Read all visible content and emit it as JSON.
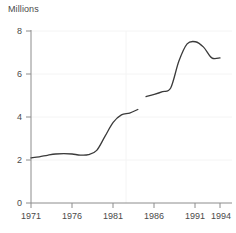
{
  "chart_data": {
    "type": "line",
    "title": "",
    "ylabel": "Millions",
    "xlabel": "",
    "ylim": [
      0,
      8
    ],
    "xlim": [
      1971,
      1994
    ],
    "yticks": [
      0,
      2,
      4,
      6,
      8
    ],
    "ytick_labels": [
      "0",
      "2",
      "4",
      "6",
      "8"
    ],
    "xticks": [
      1971,
      1976,
      1981,
      1986,
      1991,
      1994
    ],
    "xtick_labels": [
      "1971",
      "1976",
      "1981",
      "1986",
      "1991",
      "1994"
    ],
    "grid": "faint horizontal gridlines at 2, 4, 6, 8 and one faint vertical gridline at 1984",
    "gridlines_x": [
      1984
    ],
    "legend": "none",
    "line_color": "#3a3a3a",
    "axis_color": "#8c8c8c",
    "grid_color": "#f2f2f2",
    "series": [
      {
        "name": "series-part-1",
        "x": [
          1971,
          1972,
          1973,
          1974,
          1975,
          1976,
          1977,
          1978,
          1979,
          1980,
          1981,
          1982,
          1983,
          1984
        ],
        "values": [
          2.1,
          2.15,
          2.22,
          2.28,
          2.3,
          2.28,
          2.23,
          2.25,
          2.45,
          3.1,
          3.75,
          4.1,
          4.18,
          4.35
        ]
      },
      {
        "name": "series-part-2",
        "x": [
          1985,
          1986,
          1987,
          1988,
          1989,
          1990,
          1991,
          1992,
          1993,
          1994
        ],
        "values": [
          4.95,
          5.05,
          5.18,
          5.35,
          6.6,
          7.4,
          7.5,
          7.25,
          6.75,
          6.75
        ]
      }
    ],
    "break_note": "series is discontinuous between 1984 and 1985"
  }
}
